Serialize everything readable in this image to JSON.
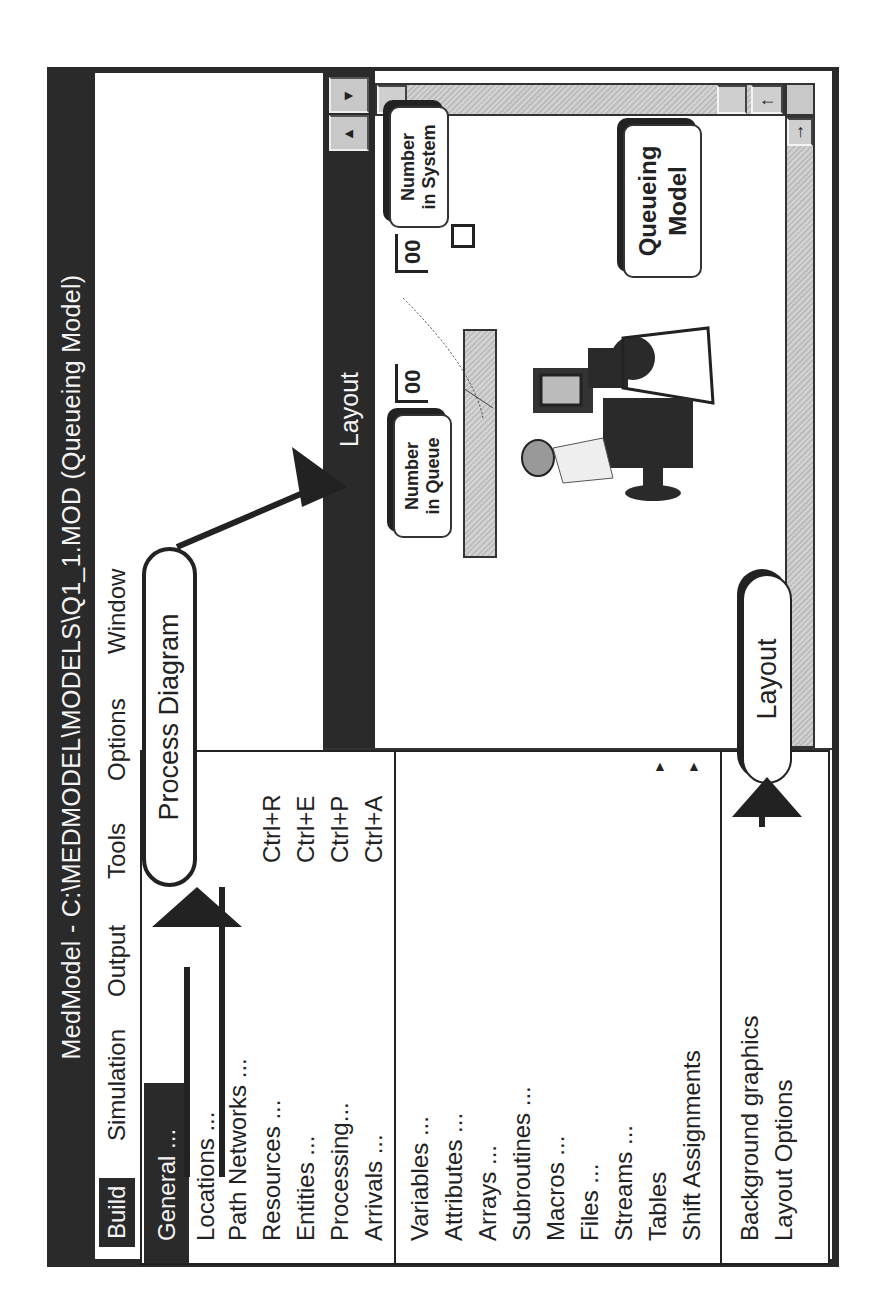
{
  "window": {
    "title": "MedModel - C:\\MEDMODEL\\MODELS\\Q1_1.MOD (Queueing Model)"
  },
  "menubar": {
    "items": [
      {
        "label": "Build",
        "active": true
      },
      {
        "label": "Simulation"
      },
      {
        "label": "Output"
      },
      {
        "label": "Tools"
      },
      {
        "label": "Options"
      },
      {
        "label": "Window"
      }
    ]
  },
  "build_menu": {
    "groups": [
      [
        {
          "label": "General ...",
          "highlight": true
        }
      ],
      [
        {
          "label": "Locations ...",
          "shortcut": ""
        },
        {
          "label": "Path Networks ...",
          "shortcut": ""
        },
        {
          "label": "Resources ...",
          "shortcut": "Ctrl+R"
        },
        {
          "label": "Entities ...",
          "shortcut": "Ctrl+E"
        },
        {
          "label": "Processing...",
          "shortcut": "Ctrl+P"
        },
        {
          "label": "Arrivals ...",
          "shortcut": "Ctrl+A"
        }
      ],
      [
        {
          "label": "Variables ..."
        },
        {
          "label": "Attributes ..."
        },
        {
          "label": "Arrays ..."
        },
        {
          "label": "Subroutines ..."
        },
        {
          "label": "Macros ..."
        },
        {
          "label": "Files ..."
        },
        {
          "label": "Streams ..."
        },
        {
          "label": "Tables",
          "submenu": true
        },
        {
          "label": "Shift Assignments",
          "submenu": true
        }
      ],
      [
        {
          "label": "Background graphics",
          "submenu": true
        },
        {
          "label": "Layout Options"
        }
      ]
    ]
  },
  "layout_window": {
    "title": "Layout",
    "labels": {
      "number_in_queue": [
        "Number",
        "in Queue"
      ],
      "number_in_system": [
        "Number",
        "in System"
      ],
      "model_title": [
        "Queueing",
        "Model"
      ]
    },
    "counters": {
      "queue": "00",
      "system": "00"
    },
    "scroll_icons": {
      "left": "◄",
      "right": "►",
      "arrow_left": "←",
      "arrow_right": "→",
      "arrow_up": "↑"
    }
  },
  "annotations": {
    "process_diagram": "Process Diagram",
    "layout": "Layout"
  }
}
